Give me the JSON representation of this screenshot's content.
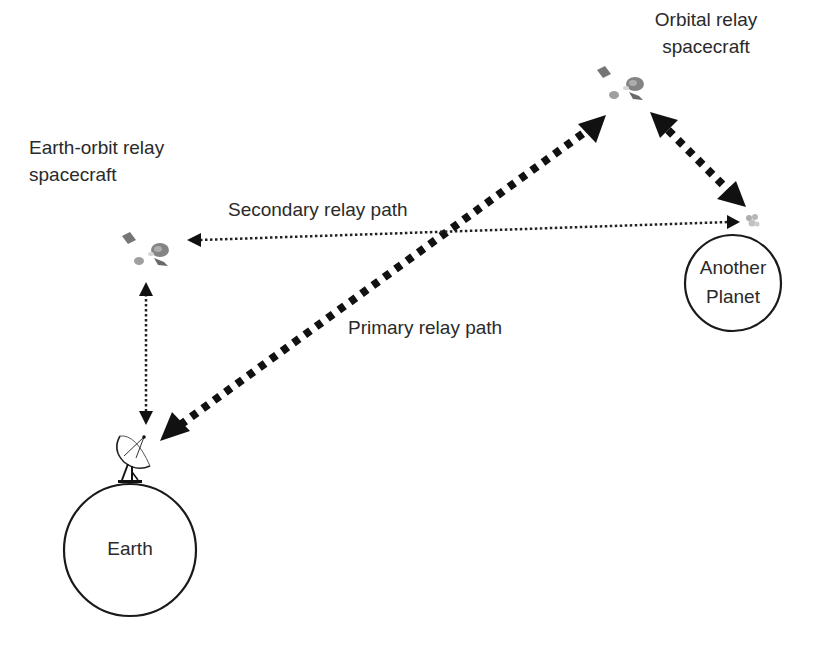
{
  "labels": {
    "orbital_relay": [
      "Orbital relay",
      "spacecraft"
    ],
    "earth_orbit_relay": [
      "Earth-orbit relay",
      "spacecraft"
    ],
    "secondary_path": "Secondary relay path",
    "primary_path": "Primary relay path",
    "another_planet": [
      "Another",
      "Planet"
    ],
    "earth": "Earth"
  },
  "nodes": [
    {
      "id": "earth",
      "label": "Earth",
      "shape": "circle"
    },
    {
      "id": "another-planet",
      "label": "Another Planet",
      "shape": "circle"
    },
    {
      "id": "ground-antenna",
      "label": "",
      "shape": "dish-antenna-icon"
    },
    {
      "id": "earth-orbit-relay",
      "label": "Earth-orbit relay spacecraft",
      "shape": "satellite-icon"
    },
    {
      "id": "orbital-relay",
      "label": "Orbital relay spacecraft",
      "shape": "satellite-icon"
    },
    {
      "id": "planet-lander",
      "label": "",
      "shape": "spacecraft-icon"
    }
  ],
  "edges": [
    {
      "from": "ground-antenna",
      "to": "orbital-relay",
      "label": "Primary relay path",
      "style": "thick-dotted",
      "direction": "both"
    },
    {
      "from": "orbital-relay",
      "to": "planet-lander",
      "label": "",
      "style": "thick-dotted",
      "direction": "both"
    },
    {
      "from": "planet-lander",
      "to": "earth-orbit-relay",
      "label": "Secondary relay path",
      "style": "thin-dotted",
      "direction": "both"
    },
    {
      "from": "earth-orbit-relay",
      "to": "ground-antenna",
      "label": "",
      "style": "thin-dotted",
      "direction": "both"
    }
  ],
  "colors": {
    "ink": "#111111",
    "text": "#2a2a2a",
    "background": "#ffffff"
  }
}
